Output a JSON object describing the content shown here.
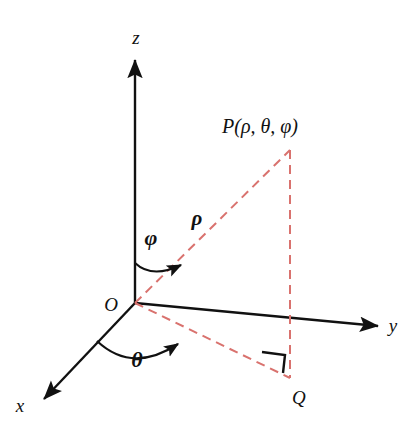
{
  "figure": {
    "background_color": "#ffffff",
    "axis_color": "#111111",
    "dashed_color": "#d9726e",
    "text_color": "#111111"
  },
  "axes": [
    {
      "id": "z",
      "label": "z",
      "direction": "up",
      "label_x": 136,
      "label_y": 44
    },
    {
      "id": "y",
      "label": "y",
      "direction": "right",
      "label_x": 393,
      "label_y": 332
    },
    {
      "id": "x",
      "label": "x",
      "direction": "down-left",
      "label_x": 20,
      "label_y": 412
    }
  ],
  "points": [
    {
      "id": "O",
      "label": "O",
      "label_x": 111,
      "label_y": 311,
      "description": "origin"
    },
    {
      "id": "P",
      "label": "P(ρ, θ, φ)",
      "label_x": 222,
      "label_y": 133,
      "description": "point in space"
    },
    {
      "id": "Q",
      "label": "Q",
      "label_x": 292,
      "label_y": 404,
      "description": "projection of P onto xy-plane"
    }
  ],
  "angles": [
    {
      "id": "phi",
      "label": "φ",
      "label_x": 151,
      "label_y": 245,
      "from_axis": "z",
      "to": "OP"
    },
    {
      "id": "theta",
      "label": "θ",
      "label_x": 137,
      "label_y": 367,
      "from_axis": "x",
      "to": "OQ"
    }
  ],
  "segments": [
    {
      "id": "rho",
      "label": "ρ",
      "label_x": 197,
      "label_y": 225,
      "from": "O",
      "to": "P",
      "style": "dashed"
    },
    {
      "id": "PQ",
      "label": "",
      "from": "P",
      "to": "Q",
      "style": "dashed"
    },
    {
      "id": "OQ",
      "label": "",
      "from": "O",
      "to": "Q",
      "style": "dashed"
    }
  ],
  "markers": [
    {
      "id": "right-angle",
      "label": "",
      "description": "right angle at Q between PQ and OQ"
    }
  ]
}
